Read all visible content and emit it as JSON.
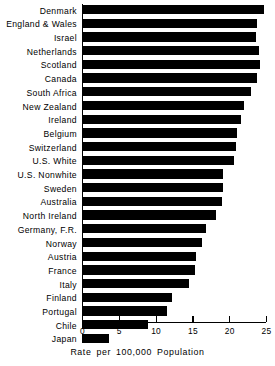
{
  "chart_data": {
    "type": "bar",
    "orientation": "horizontal",
    "title": "",
    "subtitle": "",
    "xlabel": "Rate per 100,000 Population",
    "ylabel": "",
    "xlim": [
      0,
      25
    ],
    "ylim": null,
    "grid": false,
    "legend": null,
    "legend_position": "none",
    "bar_color": "#000000",
    "background_color": "#ffffff",
    "xticks": [
      0,
      5,
      10,
      15,
      20,
      25
    ],
    "xtick_labels": [
      "0",
      "5",
      "10",
      "15",
      "20",
      "25"
    ],
    "categories": [
      "Denmark",
      "England & Wales",
      "Israel",
      "Netherlands",
      "Scotland",
      "Canada",
      "South Africa",
      "New Zealand",
      "Ireland",
      "Belgium",
      "Switzerland",
      "U.S. White",
      "U.S. Nonwhite",
      "Sweden",
      "Australia",
      "North Ireland",
      "Germany, F.R.",
      "Norway",
      "Austria",
      "France",
      "Italy",
      "Finland",
      "Portugal",
      "Chile",
      "Japan"
    ],
    "values": [
      24.7,
      23.8,
      23.7,
      24.0,
      24.2,
      23.8,
      23.0,
      22.0,
      21.6,
      21.0,
      20.9,
      20.6,
      19.2,
      19.2,
      19.0,
      18.2,
      16.8,
      16.3,
      15.5,
      15.4,
      14.6,
      12.2,
      11.6,
      9.0,
      3.7
    ],
    "annotations": []
  },
  "axis": {
    "caption": "Rate per 100,000 Population"
  }
}
